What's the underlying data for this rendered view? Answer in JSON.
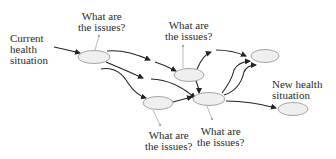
{
  "diagram": {
    "labels": {
      "start": [
        "Current",
        "health",
        "situation"
      ],
      "end": [
        "New health",
        "situation"
      ],
      "q1": [
        "What are",
        "the issues?"
      ],
      "q2": [
        "What are",
        "the issues?"
      ],
      "q3": [
        "What are",
        "the issues?"
      ],
      "q4": [
        "What are",
        "the issues?"
      ]
    },
    "nodes": [
      {
        "id": "current",
        "cx": 94,
        "cy": 57
      },
      {
        "id": "mid-top",
        "cx": 189,
        "cy": 75
      },
      {
        "id": "top-right",
        "cx": 265,
        "cy": 56
      },
      {
        "id": "mid-bottom-left",
        "cx": 158,
        "cy": 103
      },
      {
        "id": "mid-bottom",
        "cx": 209,
        "cy": 99
      },
      {
        "id": "new",
        "cx": 293,
        "cy": 109
      }
    ],
    "colors": {
      "node_fill": "#efefef",
      "node_stroke": "#9a9a9a",
      "arrow": "#222222",
      "pointer": "#aaaaaa"
    }
  }
}
